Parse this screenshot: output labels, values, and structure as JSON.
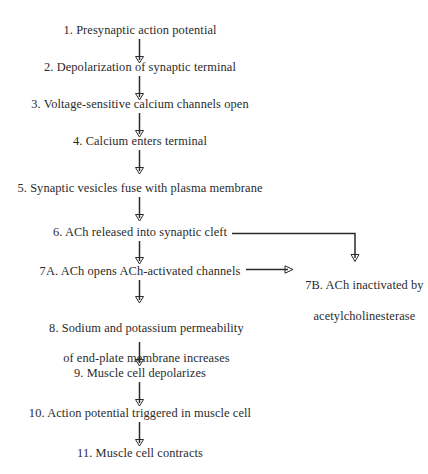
{
  "diagram": {
    "background_color": "#ffffff",
    "text_color": "#2b2b2b",
    "line_color": "#2b2b2b",
    "steps": [
      {
        "id": "step-1",
        "label": "1. Presynaptic action potential"
      },
      {
        "id": "step-2",
        "label": "2. Depolarization of synaptic terminal"
      },
      {
        "id": "step-3",
        "label": "3. Voltage-sensitive calcium channels open"
      },
      {
        "id": "step-4",
        "label": "4. Calcium enters terminal"
      },
      {
        "id": "step-5",
        "label": "5. Synaptic vesicles fuse with plasma membrane"
      },
      {
        "id": "step-6",
        "label": "6. ACh released into synaptic cleft"
      },
      {
        "id": "step-7a",
        "label": "7A. ACh opens ACh-activated channels"
      },
      {
        "id": "step-7b",
        "label_line1": "7B. ACh inactivated by",
        "label_line2": "acetylcholinesterase"
      },
      {
        "id": "step-8",
        "label_line1": "8. Sodium and potassium permeability",
        "label_line2": "of end-plate membrane increases"
      },
      {
        "id": "step-9",
        "label": "9. Muscle cell depolarizes"
      },
      {
        "id": "step-10",
        "label": "10. Action potential triggered in muscle cell"
      },
      {
        "id": "step-11",
        "label": "11. Muscle cell contracts"
      }
    ],
    "connectors": [
      {
        "id": "arrow-1-2",
        "type": "vertical-arrow-down"
      },
      {
        "id": "arrow-2-3",
        "type": "vertical-arrow-down"
      },
      {
        "id": "arrow-3-4",
        "type": "vertical-arrow-down"
      },
      {
        "id": "arrow-4-5",
        "type": "vertical-arrow-down"
      },
      {
        "id": "arrow-5-6",
        "type": "vertical-arrow-down"
      },
      {
        "id": "arrow-6-7a",
        "type": "vertical-arrow-down"
      },
      {
        "id": "arrow-6-7b",
        "type": "elbow-arrow-right-down"
      },
      {
        "id": "arrow-7a-7b",
        "type": "horizontal-arrow-right"
      },
      {
        "id": "arrow-7a-8",
        "type": "vertical-arrow-down"
      },
      {
        "id": "arrow-8-9",
        "type": "vertical-arrow-down"
      },
      {
        "id": "arrow-9-10",
        "type": "vertical-arrow-down"
      },
      {
        "id": "arrow-10-11",
        "type": "vertical-arrow-down"
      }
    ]
  }
}
